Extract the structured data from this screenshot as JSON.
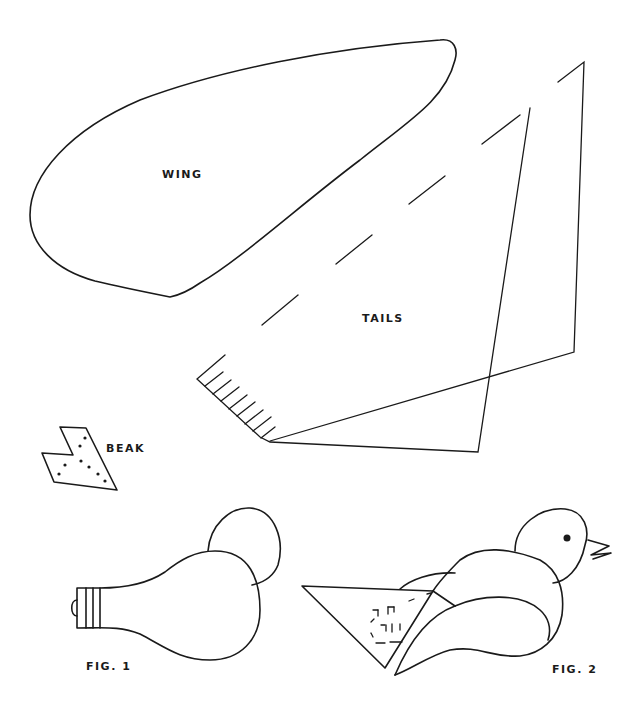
{
  "labels": {
    "wing": "WING",
    "tails": "TAILS",
    "beak": "BEAK",
    "fig1": "FIG. 1",
    "fig2": "FIG. 2"
  },
  "colors": {
    "ink": "#1a1a1a",
    "paper": "#ffffff"
  }
}
